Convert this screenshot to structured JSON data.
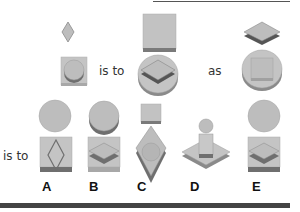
{
  "puzzle": {
    "type": "visual-analogy",
    "row1": {
      "first_figure": "diamond above square containing cylinder",
      "connector1": "is to",
      "second_figure": "square above cylinder containing flat diamond",
      "connector2": "as",
      "third_figure": "flat diamond above cylinder containing square"
    },
    "row2": {
      "connector": "is to",
      "options": [
        {
          "label": "A",
          "description": "circle above square containing diamond"
        },
        {
          "label": "B",
          "description": "cylinder above square containing flat diamond"
        },
        {
          "label": "C",
          "description": "square above diamond containing circle"
        },
        {
          "label": "D",
          "description": "circle above flat diamond containing square"
        },
        {
          "label": "E",
          "description": "circle above square containing flat diamond"
        }
      ]
    }
  },
  "colors": {
    "shape_fill": "#bdbdbd",
    "shape_light": "#c8c8c8",
    "shape_shadow": "#6f6f6f",
    "shape_dark": "#555555",
    "rule": "#444444"
  }
}
